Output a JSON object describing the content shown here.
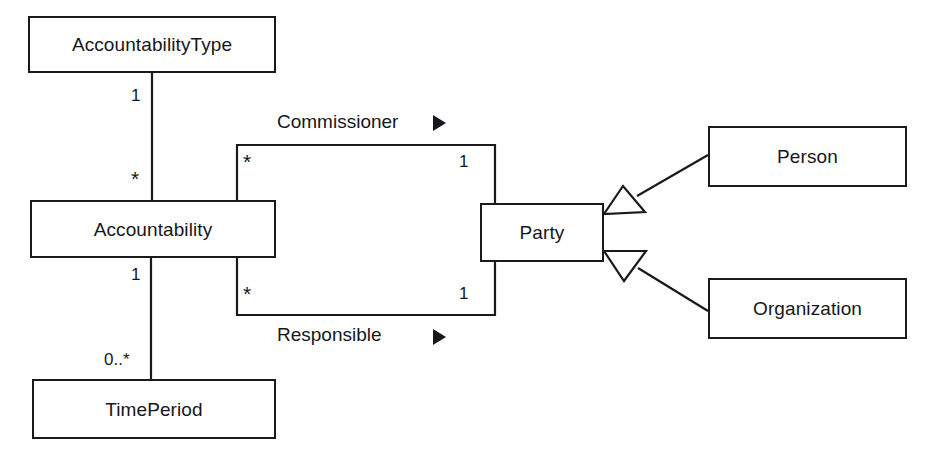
{
  "diagram": {
    "background_color": "#ffffff",
    "line_color": "#1a1a1a",
    "text_color": "#16171a",
    "classes": [
      {
        "id": "accountability-type",
        "name": "AccountabilityType",
        "x": 28,
        "y": 16,
        "w": 248,
        "h": 57
      },
      {
        "id": "accountability",
        "name": "Accountability",
        "x": 30,
        "y": 200,
        "w": 246,
        "h": 58
      },
      {
        "id": "time-period",
        "name": "TimePeriod",
        "x": 32,
        "y": 379,
        "w": 244,
        "h": 60
      },
      {
        "id": "party",
        "name": "Party",
        "x": 480,
        "y": 203,
        "w": 124,
        "h": 59
      },
      {
        "id": "person",
        "name": "Person",
        "x": 708,
        "y": 126,
        "w": 199,
        "h": 61
      },
      {
        "id": "organization",
        "name": "Organization",
        "x": 708,
        "y": 278,
        "w": 199,
        "h": 61
      }
    ],
    "associations": [
      {
        "id": "commissioner",
        "name": "Commissioner",
        "direction_marker": "▶",
        "source": "accountability",
        "target": "party",
        "source_multiplicity": "*",
        "target_multiplicity": "1"
      },
      {
        "id": "responsible",
        "name": "Responsible",
        "direction_marker": "▶",
        "source": "accountability",
        "target": "party",
        "source_multiplicity": "*",
        "target_multiplicity": "1"
      },
      {
        "id": "type-of-accountability",
        "name": "",
        "source": "accountability-type",
        "target": "accountability",
        "source_multiplicity": "1",
        "target_multiplicity": "*"
      },
      {
        "id": "accountability-timeperiod",
        "name": "",
        "source": "accountability",
        "target": "time-period",
        "source_multiplicity": "1",
        "target_multiplicity": "0..*"
      }
    ],
    "generalizations": [
      {
        "id": "person-is-a-party",
        "subclass": "person",
        "superclass": "party"
      },
      {
        "id": "organization-is-a-party",
        "subclass": "organization",
        "superclass": "party"
      }
    ],
    "labels": {
      "mult_type_top": "1",
      "mult_accountability_from_type": "*",
      "mult_accountability_to_timeperiod": "1",
      "mult_timeperiod": "0..*",
      "mult_commissioner_left": "*",
      "mult_commissioner_right": "1",
      "mult_responsible_left": "*",
      "mult_responsible_right": "1",
      "assoc_commissioner": "Commissioner",
      "assoc_responsible": "Responsible",
      "arrow_glyph": "▶"
    }
  }
}
